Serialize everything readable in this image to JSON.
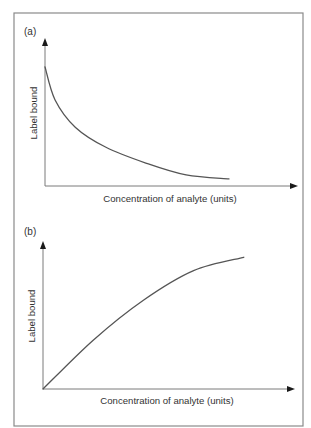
{
  "chart_data": [
    {
      "panel": "(a)",
      "type": "line",
      "title": "",
      "xlabel": "Concentration of analyte (units)",
      "ylabel": "Label bound",
      "xlim": [
        0,
        10
      ],
      "ylim": [
        0,
        1
      ],
      "grid": false,
      "legend": "none",
      "ticks_shown": false,
      "series": [
        {
          "name": "Label bound (competitive assay)",
          "x": [
            0,
            0.4,
            1.2,
            2.4,
            4.0,
            5.6,
            7.3
          ],
          "y": [
            0.81,
            0.585,
            0.4,
            0.265,
            0.156,
            0.075,
            0.048
          ]
        }
      ]
    },
    {
      "panel": "(b)",
      "type": "line",
      "title": "",
      "xlabel": "Concentration of analyte (units)",
      "ylabel": "Label bound",
      "xlim": [
        0,
        10
      ],
      "ylim": [
        0,
        1
      ],
      "grid": false,
      "legend": "none",
      "ticks_shown": false,
      "series": [
        {
          "name": "Label bound (non-competitive assay)",
          "x": [
            0,
            2.0,
            4.0,
            6.0,
            8.0
          ],
          "y": [
            0,
            0.33,
            0.6,
            0.8,
            0.89
          ]
        }
      ]
    }
  ],
  "colors": {
    "curve": "#555555",
    "axis": "#7a7a7a",
    "frame": "#8a8a8a",
    "arrow": "#1a1a1a"
  }
}
